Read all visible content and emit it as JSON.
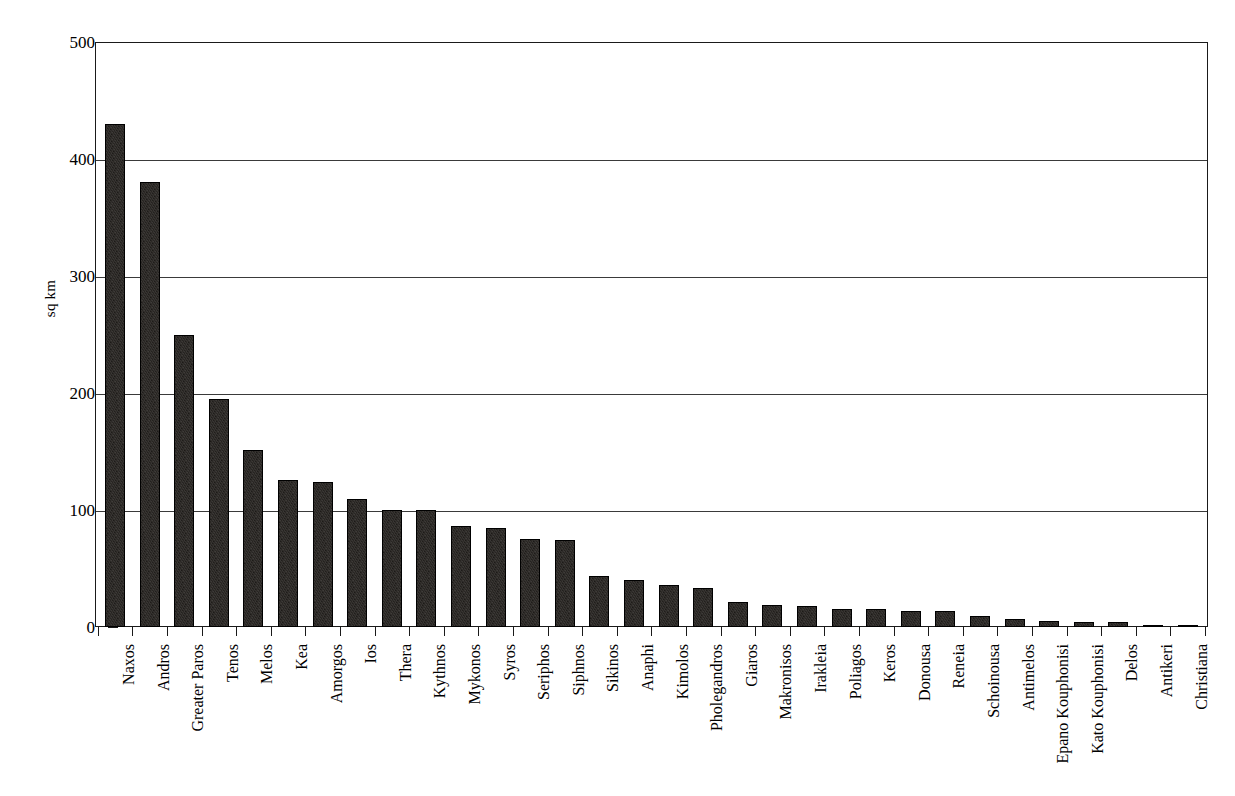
{
  "chart_data": {
    "type": "bar",
    "title": "",
    "xlabel": "",
    "ylabel": "sq km",
    "ylim": [
      0,
      500
    ],
    "yticks": [
      0,
      100,
      200,
      300,
      400,
      500
    ],
    "grid": true,
    "legend": "none",
    "orientation": "vertical",
    "categories": [
      "Naxos",
      "Andros",
      "Greater Paros",
      "Tenos",
      "Melos",
      "Kea",
      "Amorgos",
      "Ios",
      "Thera",
      "Kythnos",
      "Mykonos",
      "Syros",
      "Seriphos",
      "Siphnos",
      "Sikinos",
      "Anaphi",
      "Kimolos",
      "Pholegandros",
      "Giaros",
      "Makronisos",
      "Irakleia",
      "Poliagos",
      "Keros",
      "Donousa",
      "Reneia",
      "Schoinousa",
      "Antimelos",
      "Epano Kouphonisi",
      "Kato Kouphonisi",
      "Delos",
      "Antikeri",
      "Christiana"
    ],
    "values": [
      430,
      380,
      250,
      195,
      151,
      126,
      124,
      109,
      100,
      100,
      86,
      85,
      75,
      74,
      44,
      40,
      36,
      33,
      21,
      19,
      18,
      15,
      15,
      14,
      14,
      9,
      7,
      5,
      4,
      4,
      2,
      2
    ],
    "units": "sq km"
  },
  "axis": {
    "y_title": "sq km",
    "y_tick_labels": [
      "500",
      "400",
      "300",
      "200",
      "100",
      "0"
    ]
  }
}
